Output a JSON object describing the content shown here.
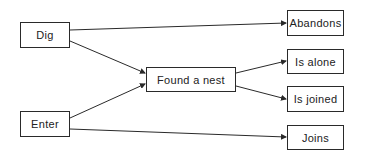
{
  "nodes": {
    "dig": {
      "label": "Dig",
      "x": 20,
      "y": 22,
      "w": 50,
      "h": 26
    },
    "enter": {
      "label": "Enter",
      "x": 20,
      "y": 111,
      "w": 50,
      "h": 26
    },
    "found": {
      "label": "Found a nest",
      "x": 146,
      "y": 67,
      "w": 90,
      "h": 25
    },
    "abandons": {
      "label": "Abandons",
      "x": 287,
      "y": 10,
      "w": 57,
      "h": 26
    },
    "alone": {
      "label": "Is alone",
      "x": 287,
      "y": 49,
      "w": 57,
      "h": 25
    },
    "joined": {
      "label": "Is joined",
      "x": 287,
      "y": 86,
      "w": 57,
      "h": 26
    },
    "joins": {
      "label": "Joins",
      "x": 287,
      "y": 125,
      "w": 57,
      "h": 25
    }
  },
  "edges": [
    {
      "from": "Dig",
      "to": "Abandons"
    },
    {
      "from": "Dig",
      "to": "Found a nest"
    },
    {
      "from": "Enter",
      "to": "Found a nest"
    },
    {
      "from": "Enter",
      "to": "Joins"
    },
    {
      "from": "Found a nest",
      "to": "Is alone"
    },
    {
      "from": "Found a nest",
      "to": "Is joined"
    }
  ],
  "colors": {
    "line": "#2a2a2a",
    "background": "#ffffff"
  }
}
